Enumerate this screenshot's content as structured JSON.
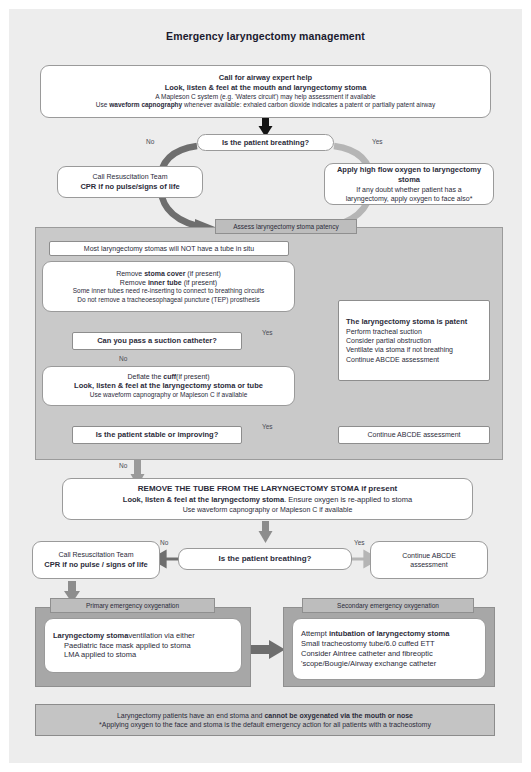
{
  "title": "Emergency laryngectomy management",
  "colors": {
    "page_bg": "#ededed",
    "panel_gray": "#c9c9c9",
    "panel_dark_gray": "#a7a7a7",
    "header_tab_gray": "#bdbdbd",
    "footer_gray": "#c4c4c4",
    "arrow_dark": "#6e6e6e",
    "arrow_light": "#b5b5b5",
    "arrow_black": "#141414",
    "text": "#2b2b3a"
  },
  "top_box": {
    "line1": "Call for airway expert help",
    "line2": "Look, listen & feel at the mouth and laryngectomy stoma",
    "line3": "A Mapleson C system (e.g. 'Waters circuit') may help assessment if available",
    "line4_a": "Use ",
    "line4_b": "waveform capnography",
    "line4_c": " whenever available: exhaled carbon dioxide indicates a patent or partially patent airway"
  },
  "decision1": {
    "label": "Is the patient breathing?",
    "no_label": "No",
    "yes_label": "Yes"
  },
  "resus_box_1": {
    "line1": "Call Resuscitation Team",
    "line2": "CPR if no pulse/signs of life"
  },
  "oxygen_box": {
    "line1": "Apply high flow oxygen to laryngectomy stoma",
    "line2": "If any doubt whether patient has a",
    "line3": "laryngectomy, apply oxygen to face also*"
  },
  "panel": {
    "header": "Assess laryngectomy stoma patency",
    "note_box": "Most laryngectomy stomas will NOT have a tube in situ",
    "remove_box": {
      "line1_a": "Remove ",
      "line1_b": "stoma cover",
      "line1_c": " (if present)",
      "line2_a": "Remove ",
      "line2_b": "inner tube",
      "line2_c": " (if present)",
      "line3": "Some inner tubes need re-inserting to connect to breathing circuits",
      "line4": "Do not remove a tracheoesophageal puncture (TEP) prosthesis"
    },
    "decision_suction": {
      "label": "Can you pass a suction catheter?",
      "yes_label": "Yes",
      "no_label": "No"
    },
    "patent_box": {
      "line1": "The laryngectomy stoma is patent",
      "line2": "Perform tracheal suction",
      "line3": "Consider partial obstruction",
      "line4": "Ventilate via stoma if not breathing",
      "line5": "Continue ABCDE assessment"
    },
    "cuff_box": {
      "line1_a": "Deflate the ",
      "line1_b": "cuff",
      "line1_c": "(if present)",
      "line2": "Look, listen & feel at the laryngectomy stoma or tube",
      "line3": "Use waveform capnography or Mapleson C if available"
    },
    "decision_stable": {
      "label": "Is the patient stable or improving?",
      "yes_label": "Yes",
      "no_label": "No"
    },
    "continue_abcde": "Continue ABCDE assessment"
  },
  "remove_tube_box": {
    "line1_a": "REMOVE THE TUBE FROM THE LARYNGECTOMY STOMA",
    "line1_b": " if present",
    "line2_a": "Look, listen & feel at the laryngectomy stoma",
    "line2_b": ". Ensure oxygen is re-applied to stoma",
    "line3": "Use waveform capnography or Mapleson C if available"
  },
  "decision2": {
    "label": "Is the patient breathing?",
    "no_label": "No",
    "yes_label": "Yes"
  },
  "resus_box_2": {
    "line1": "Call Resuscitation Team",
    "line2": "CPR if no pulse / signs of life"
  },
  "continue_abcde_2": {
    "line1": "Continue ABCDE",
    "line2": "assessment"
  },
  "primary_oxygenation": {
    "header": "Primary emergency oxygenation",
    "line1_a": "Laryngectomy stoma",
    "line1_b": "ventilation via either",
    "line2": "Paediatric face mask applied to stoma",
    "line3": "LMA applied to stoma"
  },
  "secondary_oxygenation": {
    "header": "Secondary emergency oxygenation",
    "line1_a": "Attempt ",
    "line1_b": "intubation of laryngectomy stoma",
    "line2": "Small tracheostomy tube/6.0 cuffed ETT",
    "line3": "Consider Aintree catheter and fibreoptic",
    "line4": "'scope/Bougie/Airway exchange catheter"
  },
  "footer": {
    "line1_a": "Laryngectomy patients have an end stoma and ",
    "line1_b": "cannot be oxygenated via the mouth or nose",
    "line2": "*Applying oxygen to the face and stoma is the default emergency action for all patients with a tracheostomy"
  }
}
